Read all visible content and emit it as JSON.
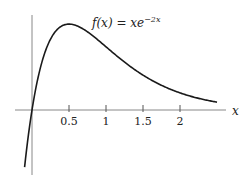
{
  "chart_data": {
    "type": "line",
    "title_parts": {
      "lhs": "f(x) = xe",
      "exp": "−2x"
    },
    "xlabel": "x",
    "ylabel": "",
    "xlim": [
      -0.1,
      2.5
    ],
    "ylim": [
      -0.13,
      0.2
    ],
    "x_ticks": [
      0.5,
      1,
      1.5,
      2
    ],
    "x_tick_labels": [
      "0.5",
      "1",
      "1.5",
      "2"
    ],
    "grid": false,
    "series": [
      {
        "name": "f(x) = xe^{-2x}",
        "function": "x*exp(-2x)",
        "x": [
          -0.1,
          0,
          0.1,
          0.2,
          0.3,
          0.4,
          0.5,
          0.75,
          1.0,
          1.25,
          1.5,
          1.75,
          2.0,
          2.25,
          2.5
        ],
        "values": [
          -0.122,
          0,
          0.082,
          0.134,
          0.165,
          0.18,
          0.184,
          0.167,
          0.135,
          0.103,
          0.075,
          0.053,
          0.037,
          0.025,
          0.017
        ]
      }
    ],
    "annotations": [
      {
        "text": "max at x = 0.5",
        "implicit": true
      }
    ]
  }
}
